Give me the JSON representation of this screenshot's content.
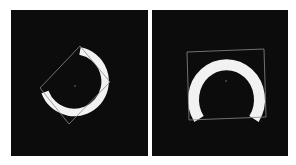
{
  "figure": {
    "background": "#ffffff",
    "panels": [
      {
        "id": "left",
        "background": "#0c0c0c",
        "shape": "horseshoe-ring",
        "shape_color": "#f2f2f2",
        "box_color": "#8a8a8a",
        "center_marker": true
      },
      {
        "id": "right",
        "background": "#0c0c0c",
        "shape": "horseshoe-ring",
        "shape_color": "#f2f2f2",
        "box_color": "#8a8a8a",
        "center_marker": true
      }
    ]
  }
}
